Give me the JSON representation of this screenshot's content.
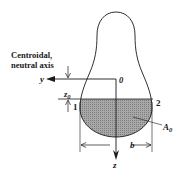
{
  "diagram": {
    "type": "beam cross-section with centroidal neutral axis",
    "labels": {
      "axis_title_line1": "Centroidal,",
      "axis_title_line2": "neutral axis",
      "y_axis": "y",
      "z_axis": "z",
      "origin": "0",
      "z0": "z",
      "z0_sub": "0",
      "point1": "1",
      "point2": "2",
      "area": "A",
      "area_sub": "0",
      "width": "b"
    },
    "colors": {
      "stroke": "#1a1a1a",
      "shaded_area": "#9a9a9a",
      "background": "#ffffff"
    }
  }
}
